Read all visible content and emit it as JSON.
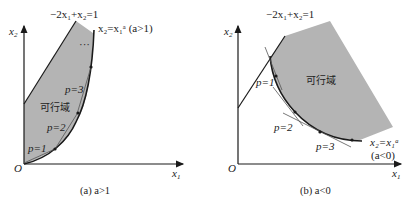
{
  "panel_a": {
    "x_axis": "x",
    "y_axis": "x",
    "origin": "O",
    "line_label": "−2x₁+x₂=1",
    "curve_label": "x₂=x₁ᵃ (a>1)",
    "region_label": "可行域",
    "ellipsis": "···",
    "p_labels": [
      "p=1",
      "p=2",
      "p=3"
    ],
    "caption": "(a) a>1"
  },
  "panel_b": {
    "x_axis": "x",
    "y_axis": "x",
    "origin": "O",
    "line_label": "−2x₁+x₂=1",
    "curve_label": "x₂=x₁ᵃ",
    "curve_cond": "(a<0)",
    "region_label": "可行域",
    "p_labels": [
      "p=1",
      "p=2",
      "p=3"
    ],
    "caption": "(b) a<0"
  },
  "colors": {
    "region": "#b4b4b4",
    "ink": "#1a1a1a"
  }
}
